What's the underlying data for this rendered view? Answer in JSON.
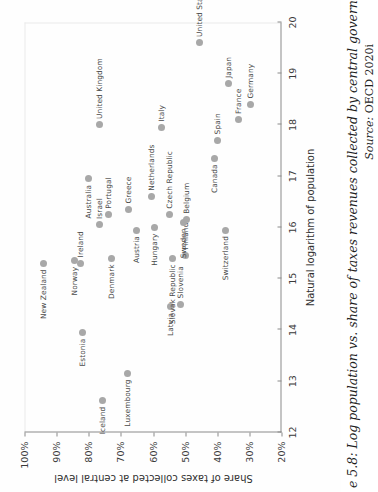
{
  "caption": {
    "figure_line": "e 5.8: Log population vs. share of taxes revenues collected by central government in 2",
    "source_label": "Source:",
    "source_ref": "OECD 2020i"
  },
  "chart_data": {
    "type": "scatter",
    "title": "e 5.8: Log population vs. share of taxes revenues collected by central government in 2",
    "xlabel": "Natural logarithm of population",
    "ylabel": "Share of taxes collected at central level",
    "xlim": [
      12,
      20
    ],
    "ylim": [
      20,
      100
    ],
    "xticks": [
      "12",
      "13",
      "14",
      "15",
      "16",
      "17",
      "18",
      "19",
      "20"
    ],
    "yticks": [
      "20%",
      "30%",
      "40%",
      "50%",
      "60%",
      "70%",
      "80%",
      "90%",
      "100%"
    ],
    "grid": false,
    "legend": "none",
    "marker_color": "#a8a8a8",
    "points": [
      {
        "label": "Iceland",
        "x": 12.62,
        "y": 75.8,
        "side": "left"
      },
      {
        "label": "Luxembourg",
        "x": 13.15,
        "y": 68.0,
        "side": "left"
      },
      {
        "label": "Estonia",
        "x": 13.95,
        "y": 82.0,
        "side": "left"
      },
      {
        "label": "Latvia",
        "x": 14.45,
        "y": 54.5,
        "side": "left"
      },
      {
        "label": "Slovenia",
        "x": 14.5,
        "y": 51.5,
        "side": "right"
      },
      {
        "label": "New Zealand",
        "x": 15.3,
        "y": 94.0,
        "side": "left"
      },
      {
        "label": "Norway",
        "x": 15.35,
        "y": 84.5,
        "side": "left"
      },
      {
        "label": "Ireland",
        "x": 15.3,
        "y": 82.5,
        "side": "right"
      },
      {
        "label": "Denmark",
        "x": 15.4,
        "y": 73.0,
        "side": "left"
      },
      {
        "label": "Slovak Republic",
        "x": 15.4,
        "y": 54.0,
        "side": "left"
      },
      {
        "label": "Finland",
        "x": 15.45,
        "y": 50.0,
        "side": "right"
      },
      {
        "label": "Switzerland",
        "x": 15.95,
        "y": 37.5,
        "side": "left"
      },
      {
        "label": "Austria",
        "x": 15.95,
        "y": 65.0,
        "side": "left"
      },
      {
        "label": "Hungary",
        "x": 16.0,
        "y": 59.5,
        "side": "left"
      },
      {
        "label": "Israel",
        "x": 16.05,
        "y": 76.5,
        "side": "right"
      },
      {
        "label": "Sweden",
        "x": 16.1,
        "y": 50.5,
        "side": "left"
      },
      {
        "label": "Belgium",
        "x": 16.15,
        "y": 49.5,
        "side": "right"
      },
      {
        "label": "Portugal",
        "x": 16.25,
        "y": 74.0,
        "side": "right"
      },
      {
        "label": "Czech Republic",
        "x": 16.25,
        "y": 55.0,
        "side": "right"
      },
      {
        "label": "Greece",
        "x": 16.35,
        "y": 67.5,
        "side": "right"
      },
      {
        "label": "Netherlands",
        "x": 16.6,
        "y": 60.5,
        "side": "right"
      },
      {
        "label": "Australia",
        "x": 16.95,
        "y": 80.0,
        "side": "left"
      },
      {
        "label": "Canada",
        "x": 17.35,
        "y": 41.0,
        "side": "left"
      },
      {
        "label": "Spain",
        "x": 17.7,
        "y": 40.0,
        "side": "right"
      },
      {
        "label": "Italy",
        "x": 17.95,
        "y": 57.5,
        "side": "right"
      },
      {
        "label": "France",
        "x": 18.1,
        "y": 33.5,
        "side": "right"
      },
      {
        "label": "Germany",
        "x": 18.4,
        "y": 29.5,
        "side": "right"
      },
      {
        "label": "Japan",
        "x": 18.8,
        "y": 36.5,
        "side": "right"
      },
      {
        "label": "United Kingdom",
        "x": 18.0,
        "y": 76.5,
        "side": "right"
      },
      {
        "label": "United States",
        "x": 19.6,
        "y": 45.5,
        "side": "right"
      }
    ]
  }
}
